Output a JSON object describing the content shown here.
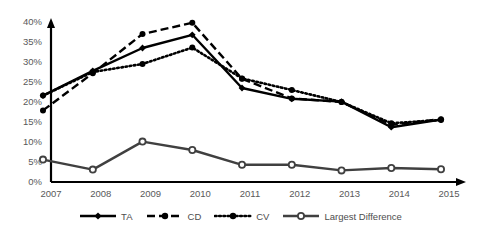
{
  "chart_data": {
    "type": "line",
    "title": "",
    "subtitle": "",
    "xlabel": "",
    "ylabel": "",
    "x": [
      2007,
      2008,
      2009,
      2010,
      2011,
      2012,
      2013,
      2014,
      2015
    ],
    "categories": [
      "2007",
      "2008",
      "2009",
      "2010",
      "2011",
      "2012",
      "2013",
      "2014",
      "2015"
    ],
    "xlim": [
      2007,
      2015
    ],
    "ylim": [
      0,
      40
    ],
    "ytick_labels": [
      "0%",
      "5%",
      "10%",
      "15%",
      "20%",
      "25%",
      "30%",
      "35%",
      "40%"
    ],
    "ytick_values": [
      0,
      5,
      10,
      15,
      20,
      25,
      30,
      35,
      40
    ],
    "grid": false,
    "legend_position": "bottom",
    "value_unit": "%",
    "series": [
      {
        "name": "TA",
        "line_style": "solid",
        "marker": "filled-diamond",
        "color": "#000000",
        "values": [
          21.6,
          27.8,
          33.5,
          36.8,
          23.5,
          20.8,
          20.1,
          13.7,
          15.6
        ]
      },
      {
        "name": "CD",
        "line_style": "dashed",
        "marker": "filled-circle",
        "color": "#000000",
        "values": [
          17.9,
          27.2,
          37.0,
          39.8,
          25.8,
          20.9,
          20.0,
          14.3,
          15.7
        ]
      },
      {
        "name": "CV",
        "line_style": "dotted",
        "marker": "filled-circle",
        "color": "#000000",
        "values": [
          21.6,
          27.5,
          29.5,
          33.6,
          25.9,
          23.0,
          20.0,
          14.7,
          15.5
        ]
      },
      {
        "name": "Largest Difference",
        "line_style": "solid",
        "marker": "open-circle",
        "color": "#404040",
        "values": [
          5.6,
          3.1,
          10.1,
          8.0,
          4.3,
          4.3,
          2.9,
          3.5,
          3.2
        ]
      }
    ]
  },
  "axes": {
    "y_axis_name": "percentage-axis",
    "x_axis_name": "year-axis"
  }
}
